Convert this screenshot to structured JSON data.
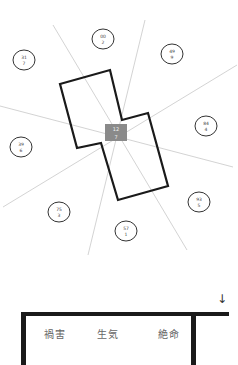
{
  "diagram": {
    "center": {
      "x": 116,
      "y": 132,
      "line1": "12",
      "line2": "7"
    },
    "radial_lines": [
      {
        "x1": 53,
        "y1": 25,
        "x2": 187,
        "y2": 250
      },
      {
        "x1": 145,
        "y1": 20,
        "x2": 88,
        "y2": 255
      },
      {
        "x1": 0,
        "y1": 106,
        "x2": 233,
        "y2": 167
      },
      {
        "x1": 237,
        "y1": 65,
        "x2": 3,
        "y2": 207
      }
    ],
    "house_outline": "60,84 110,70 122,120 148,113 168,186 118,200 101,143 77,148",
    "sectors": [
      {
        "x": 103,
        "y": 39,
        "line1": "00",
        "line2": "2"
      },
      {
        "x": 24,
        "y": 60,
        "line1": "31",
        "line2": "7"
      },
      {
        "x": 172,
        "y": 54,
        "line1": "49",
        "line2": "9"
      },
      {
        "x": 206,
        "y": 126,
        "line1": "84",
        "line2": "4"
      },
      {
        "x": 21,
        "y": 147,
        "line1": "39",
        "line2": "6"
      },
      {
        "x": 199,
        "y": 202,
        "line1": "93",
        "line2": "5"
      },
      {
        "x": 59,
        "y": 212,
        "line1": "75",
        "line2": "3"
      },
      {
        "x": 126,
        "y": 231,
        "line1": "57",
        "line2": "1"
      }
    ],
    "colors": {
      "outline": "#1a1a1a",
      "lines": "#c8c8c8",
      "center_box": "#8a8a8a"
    }
  },
  "floor_plan": {
    "arrow": "↓",
    "rooms": [
      "禍害",
      "生気",
      "絶命"
    ]
  }
}
